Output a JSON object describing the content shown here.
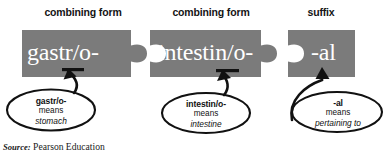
{
  "figure": {
    "source_prefix": "Source:",
    "source_text": "Pearson Education",
    "piece_color": "#7b7b7b",
    "piece_text_color": "#ffffff",
    "outline_color": "#111111",
    "background": "#ffffff"
  },
  "columns": [
    {
      "label": "combining form"
    },
    {
      "label": "combining form"
    },
    {
      "label": "suffix"
    }
  ],
  "pieces": [
    {
      "word": "gastr/o-",
      "kind": "combining form",
      "edge_left": "flat",
      "edge_right": "tab"
    },
    {
      "word": "intestin/o-",
      "kind": "combining form",
      "edge_left": "notch",
      "edge_right": "tab"
    },
    {
      "word": "-al",
      "kind": "suffix",
      "edge_left": "notch",
      "edge_right": "flat"
    }
  ],
  "callouts": [
    {
      "term": "gastr/o-",
      "means_label": "means",
      "definition": "stomach"
    },
    {
      "term": "intestin/o-",
      "means_label": "means",
      "definition": "intestine"
    },
    {
      "term": "-al",
      "means_label": "means",
      "definition": "pertaining to"
    }
  ]
}
